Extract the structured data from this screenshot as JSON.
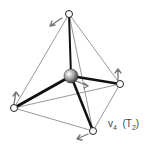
{
  "diagram": {
    "label": {
      "mode": "v",
      "mode_sub": "4",
      "symmetry": "(T",
      "symmetry_sub": "2",
      "symmetry_close": ")"
    },
    "atoms": {
      "center": {
        "x": 71,
        "y": 76,
        "r": 7
      },
      "outer": [
        {
          "name": "top",
          "x": 69,
          "y": 14
        },
        {
          "name": "right",
          "x": 120,
          "y": 84
        },
        {
          "name": "left",
          "x": 14,
          "y": 108
        },
        {
          "name": "bottom",
          "x": 93,
          "y": 131
        }
      ]
    },
    "colors": {
      "bond": "#111111",
      "edge": "#999999",
      "arrow": "#777777"
    }
  }
}
